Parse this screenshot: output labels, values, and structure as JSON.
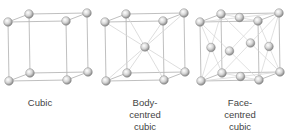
{
  "diagrams": [
    {
      "id": "cubic",
      "label_lines": [
        "Cubic"
      ]
    },
    {
      "id": "body-centred-cubic",
      "label_lines": [
        "Body-",
        "centred",
        "cubic"
      ]
    },
    {
      "id": "face-centred-cubic",
      "label_lines": [
        "Face-",
        "centred",
        "cubic"
      ]
    }
  ],
  "colors": {
    "edge": "#b8b8b8",
    "diag": "#d4d4d4",
    "sphere_light": "#ffffff",
    "sphere_dark": "#8a8a8a",
    "text": "#444444"
  }
}
